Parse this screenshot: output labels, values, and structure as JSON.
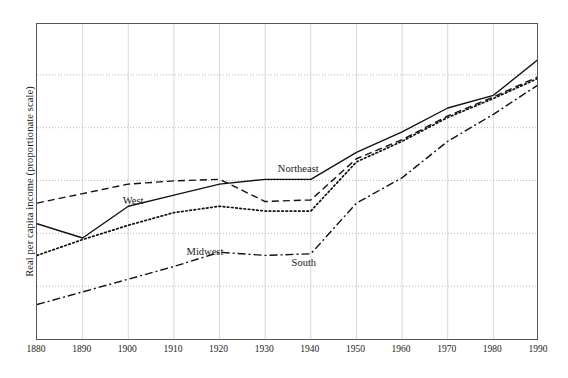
{
  "chart_data": {
    "type": "line",
    "title": "",
    "xlabel": "",
    "ylabel": "Real per capita income (proportionate scale)",
    "xlim": [
      1880,
      1990
    ],
    "x": [
      1880,
      1890,
      1900,
      1910,
      1920,
      1930,
      1940,
      1950,
      1960,
      1970,
      1980,
      1990
    ],
    "xticks": [
      "1880",
      "1890",
      "1900",
      "1910",
      "1920",
      "1930",
      "1940",
      "1950",
      "1960",
      "1970",
      "1980",
      "1990"
    ],
    "grid": true,
    "gridlines_horizontal": 5,
    "legend": "inline-labels",
    "ylim": [
      0,
      100
    ],
    "yticklabels": [],
    "series": [
      {
        "name": "Northeast",
        "style": "solid",
        "color": "#111111",
        "label_x": 1933,
        "label_y": 53.5,
        "values": [
          37.0,
          32.5,
          42.5,
          46.0,
          49.5,
          51.0,
          51.0,
          59.5,
          66.0,
          73.5,
          77.5,
          89.0
        ]
      },
      {
        "name": "West",
        "style": "dashed",
        "color": "#111111",
        "label_x": 1899,
        "label_y": 43.5,
        "values": [
          43.5,
          46.5,
          49.5,
          50.5,
          51.0,
          44.0,
          44.5,
          57.5,
          63.5,
          71.0,
          77.0,
          83.5
        ]
      },
      {
        "name": "Midwest",
        "style": "dotted",
        "color": "#111111",
        "label_x": 1913,
        "label_y": 27.5,
        "values": [
          27.0,
          32.0,
          36.5,
          40.5,
          42.5,
          41.0,
          41.0,
          56.5,
          63.0,
          70.5,
          76.5,
          83.0
        ]
      },
      {
        "name": "South",
        "style": "dashdot",
        "color": "#111111",
        "label_x": 1936,
        "label_y": 24.0,
        "values": [
          11.5,
          15.5,
          19.5,
          23.5,
          28.0,
          27.0,
          27.5,
          43.5,
          51.5,
          63.0,
          71.5,
          81.0
        ]
      }
    ]
  }
}
